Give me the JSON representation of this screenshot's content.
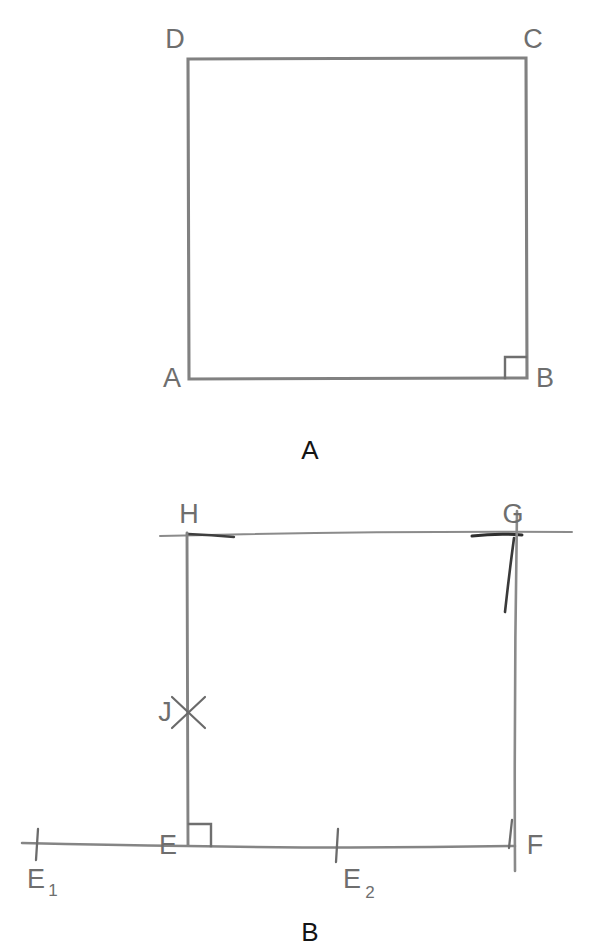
{
  "document": {
    "title": "Two hand-drawn square construction figures",
    "background_color": "#ffffff",
    "ink_color": "#808080",
    "ink_color_dark": "#4a4a4a",
    "label_color": "#6e6e6e",
    "caption_color": "#141414"
  },
  "figures": [
    {
      "id": "figure-a",
      "caption": "A",
      "caption_position": {
        "x": 310,
        "y": 450
      },
      "description": "square ABCD with right-angle mark at B",
      "square": {
        "left": 188,
        "top": 58,
        "right": 526,
        "bottom": 378
      },
      "vertices": [
        {
          "name": "D",
          "label": "D",
          "x": 188,
          "y": 58,
          "label_x": 178,
          "label_y": 48
        },
        {
          "name": "C",
          "label": "C",
          "x": 526,
          "y": 58,
          "label_x": 522,
          "label_y": 48
        },
        {
          "name": "A",
          "label": "A",
          "x": 188,
          "y": 378,
          "label_x": 178,
          "label_y": 386
        },
        {
          "name": "B",
          "label": "B",
          "x": 526,
          "y": 378,
          "label_x": 534,
          "label_y": 386
        }
      ],
      "right_angle_marks": [
        {
          "at": "B",
          "x": 506,
          "y": 358,
          "size": 21
        }
      ]
    },
    {
      "id": "figure-b",
      "caption": "B",
      "caption_position": {
        "x": 310,
        "y": 932
      },
      "description": "square EFGH with construction arcs, point J on HE, and baseline ticks E1 and E2",
      "square": {
        "left": 187,
        "top": 533,
        "right": 515,
        "bottom": 845
      },
      "vertices": [
        {
          "name": "H",
          "label": "H",
          "x": 187,
          "y": 533,
          "label_x": 179,
          "label_y": 523
        },
        {
          "name": "G",
          "label": "G",
          "x": 515,
          "y": 533,
          "label_x": 505,
          "label_y": 523
        },
        {
          "name": "E",
          "label": "E",
          "x": 187,
          "y": 845,
          "label_x": 158,
          "label_y": 853
        },
        {
          "name": "F",
          "label": "F",
          "x": 515,
          "y": 845,
          "label_x": 523,
          "label_y": 853
        }
      ],
      "right_angle_marks": [
        {
          "at": "E",
          "x": 190,
          "y": 824,
          "size": 21
        }
      ],
      "marked_points": [
        {
          "name": "J",
          "label": "J",
          "x": 187,
          "y": 712,
          "marker": "x-cross",
          "label_x": 156,
          "label_y": 720
        }
      ],
      "baseline": {
        "x1": 22,
        "x2": 515,
        "y": 845
      },
      "ticks": [
        {
          "name": "E1",
          "label": "E",
          "subscript": "1",
          "x": 37,
          "y": 845,
          "label_x": 26,
          "label_y": 886,
          "sub_x": 47,
          "sub_y": 894
        },
        {
          "name": "E2",
          "label": "E",
          "subscript": "2",
          "x": 337,
          "y": 845,
          "label_x": 342,
          "label_y": 886,
          "sub_x": 362,
          "sub_y": 894
        }
      ],
      "overshoot_lines": [
        {
          "name": "top-construction-line",
          "x1": 160,
          "y1": 534,
          "x2": 572,
          "y2": 531
        },
        {
          "name": "right-vertical-overshoot",
          "x1": 517,
          "y1": 511,
          "x2": 514,
          "y2": 871
        }
      ]
    }
  ]
}
